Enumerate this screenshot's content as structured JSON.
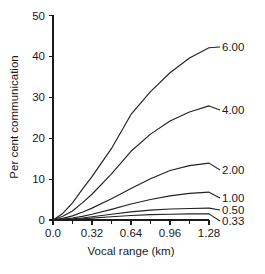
{
  "chart_data": {
    "type": "line",
    "title": "",
    "xlabel": "Vocal range (km)",
    "ylabel": "Per cent communication",
    "xlim": [
      0.0,
      1.28
    ],
    "ylim": [
      0,
      50
    ],
    "grid": false,
    "legend_position": "right-inline-end-of-line",
    "xticks": [
      "0.0",
      "0.32",
      "0.64",
      "0.96",
      "1.28"
    ],
    "xtick_values": [
      0.0,
      0.32,
      0.64,
      0.96,
      1.28
    ],
    "xminor_ticks": [
      0.16,
      0.48,
      0.8,
      1.12
    ],
    "yticks": [
      "0",
      "10",
      "20",
      "30",
      "40",
      "50"
    ],
    "ytick_values": [
      0,
      10,
      20,
      30,
      40,
      50
    ],
    "x": [
      0.0,
      0.08,
      0.16,
      0.24,
      0.32,
      0.48,
      0.64,
      0.8,
      0.96,
      1.12,
      1.28
    ],
    "series": [
      {
        "name": "6.00",
        "label": "6.00",
        "values": [
          0.0,
          1.6,
          4.2,
          7.5,
          10.6,
          17.5,
          25.8,
          31.4,
          36.0,
          39.6,
          42.1
        ]
      },
      {
        "name": "4.00",
        "label": "4.00",
        "values": [
          0.0,
          0.9,
          2.2,
          4.2,
          6.3,
          11.3,
          16.8,
          21.0,
          24.2,
          26.4,
          27.9
        ]
      },
      {
        "name": "2.00",
        "label": "2.00",
        "values": [
          0.0,
          0.4,
          1.0,
          1.9,
          2.9,
          5.2,
          7.7,
          10.1,
          12.1,
          13.3,
          13.9
        ]
      },
      {
        "name": "1.00",
        "label": "1.00",
        "values": [
          0.0,
          0.2,
          0.5,
          0.9,
          1.4,
          2.6,
          3.9,
          5.0,
          5.9,
          6.5,
          6.8
        ]
      },
      {
        "name": "0.50",
        "label": "0.50",
        "values": [
          0.0,
          0.1,
          0.3,
          0.5,
          0.8,
          1.4,
          2.0,
          2.4,
          2.7,
          2.8,
          2.9
        ]
      },
      {
        "name": "0.33",
        "label": "0.33",
        "values": [
          0.0,
          0.05,
          0.15,
          0.3,
          0.45,
          0.8,
          1.1,
          1.3,
          1.4,
          1.5,
          1.5
        ]
      }
    ]
  },
  "axes": {
    "x_title": "Vocal range (km)",
    "y_title": "Per cent communication"
  },
  "colors": {
    "ink": "#1a1a1a",
    "curve": "#222222",
    "background": "#ffffff"
  }
}
